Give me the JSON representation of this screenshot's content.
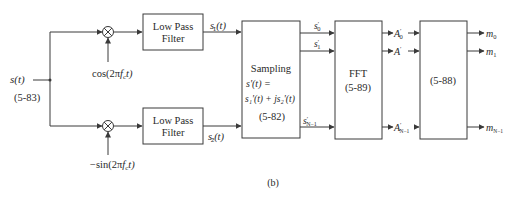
{
  "diagram": {
    "caption": "(b)",
    "input": {
      "signal_label": "s(t)",
      "equation_ref": "(5-83)"
    },
    "mixers": [
      {
        "id": "mixer-top",
        "symbol": "⊗",
        "carrier_label": "cos(2πf_c t)",
        "carrier_main": "cos(2π",
        "carrier_f": "f",
        "carrier_sub": "c",
        "carrier_tail": "t)"
      },
      {
        "id": "mixer-bottom",
        "symbol": "⊗",
        "carrier_label": "−sin(2πf_c t)",
        "carrier_main": "−sin(2π",
        "carrier_f": "f",
        "carrier_sub": "c",
        "carrier_tail": "t)"
      }
    ],
    "filters": [
      {
        "line1": "Low Pass",
        "line2": "Filter",
        "output_label": "s'_1(t)",
        "out_s": "s",
        "out_sub": "1",
        "out_tail": "(t)"
      },
      {
        "line1": "Low Pass",
        "line2": "Filter",
        "output_label": "s'_2(t)",
        "out_s": "s",
        "out_sub": "2",
        "out_tail": "(t)"
      }
    ],
    "sampling_block": {
      "title": "Sampling",
      "eq_line1": "s'(t) =",
      "eq_line2": "s₁'(t) + js₂'(t)",
      "equation_ref": "(5-82)",
      "outputs": [
        {
          "label": "s'_0",
          "s": "s",
          "sub": "0"
        },
        {
          "label": "s'_1",
          "s": "s",
          "sub": "1"
        },
        {
          "label": "s'_N-1",
          "s": "s",
          "sub": "N−1"
        }
      ]
    },
    "fft_block": {
      "title": "FFT",
      "equation_ref": "(5-89)",
      "outputs": [
        {
          "label": "A'_0",
          "a": "A",
          "sub": "0"
        },
        {
          "label": "A'_1",
          "a": "A",
          "sub": "1"
        },
        {
          "label": "A'_N-1",
          "a": "A",
          "sub": "N−1"
        }
      ]
    },
    "decision_block": {
      "equation_ref": "(5-88)",
      "outputs": [
        {
          "label": "m_0",
          "m": "m",
          "sub": "0"
        },
        {
          "label": "m_1",
          "m": "m",
          "sub": "1"
        },
        {
          "label": "m_N-1",
          "m": "m",
          "sub": "N−1"
        }
      ]
    },
    "colors": {
      "line": "#3a3a3a",
      "text": "#2a2a2a",
      "background": "#ffffff"
    }
  }
}
